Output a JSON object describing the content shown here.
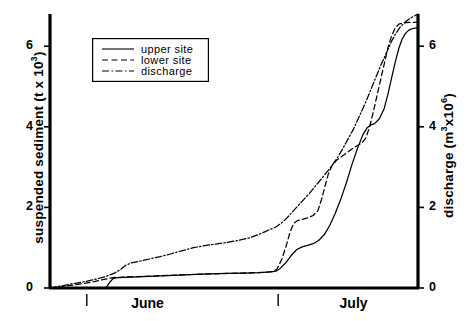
{
  "chart_data": {
    "type": "line",
    "title": "",
    "xlabel": "",
    "ylabel": "suspended sediment (t x 10³)",
    "ylabel_parts": {
      "main": "suspended sediment (t x 10",
      "sup": "3",
      "tail": ")"
    },
    "y2label": "discharge (m³x10⁶)",
    "y2label_parts": {
      "main": "discharge (m",
      "sup": "3",
      "mid": "x10",
      "sup2": "6",
      "tail": ")"
    },
    "ylim": [
      0,
      6.8
    ],
    "y2lim": [
      0,
      6.8
    ],
    "yticks": [
      "0",
      "2",
      "4",
      "6"
    ],
    "ytick_values": [
      0,
      2,
      4,
      6
    ],
    "y2ticks": [
      "0",
      "2",
      "4",
      "6"
    ],
    "y2tick_values": [
      0,
      2,
      4,
      6
    ],
    "xticks": [
      "June",
      "July"
    ],
    "xtick_marks": [
      0.1,
      0.62
    ],
    "grid": false,
    "legend_position": "upper left",
    "legend_entries": [
      {
        "label": "upper site",
        "style": "solid"
      },
      {
        "label": "lower site",
        "style": "dashed"
      },
      {
        "label": "discharge",
        "style": "dashdot"
      }
    ],
    "series": [
      {
        "name": "upper site",
        "style": "solid",
        "axis": "left",
        "points": [
          [
            0.0,
            0.0
          ],
          [
            0.04,
            0.0
          ],
          [
            0.08,
            0.0
          ],
          [
            0.12,
            0.0
          ],
          [
            0.15,
            0.0
          ],
          [
            0.155,
            0.04
          ],
          [
            0.163,
            0.15
          ],
          [
            0.172,
            0.24
          ],
          [
            0.185,
            0.26
          ],
          [
            0.22,
            0.27
          ],
          [
            0.27,
            0.29
          ],
          [
            0.32,
            0.31
          ],
          [
            0.38,
            0.33
          ],
          [
            0.43,
            0.35
          ],
          [
            0.48,
            0.36
          ],
          [
            0.53,
            0.37
          ],
          [
            0.57,
            0.38
          ],
          [
            0.6,
            0.4
          ],
          [
            0.615,
            0.42
          ],
          [
            0.625,
            0.48
          ],
          [
            0.64,
            0.62
          ],
          [
            0.655,
            0.8
          ],
          [
            0.67,
            0.95
          ],
          [
            0.685,
            1.02
          ],
          [
            0.7,
            1.06
          ],
          [
            0.715,
            1.1
          ],
          [
            0.73,
            1.18
          ],
          [
            0.745,
            1.32
          ],
          [
            0.76,
            1.55
          ],
          [
            0.775,
            1.85
          ],
          [
            0.79,
            2.2
          ],
          [
            0.805,
            2.6
          ],
          [
            0.82,
            3.05
          ],
          [
            0.835,
            3.45
          ],
          [
            0.85,
            3.8
          ],
          [
            0.862,
            3.98
          ],
          [
            0.872,
            4.05
          ],
          [
            0.882,
            4.08
          ],
          [
            0.895,
            4.2
          ],
          [
            0.908,
            4.45
          ],
          [
            0.918,
            4.8
          ],
          [
            0.928,
            5.2
          ],
          [
            0.938,
            5.6
          ],
          [
            0.948,
            5.95
          ],
          [
            0.957,
            6.18
          ],
          [
            0.966,
            6.32
          ],
          [
            0.975,
            6.4
          ],
          [
            0.985,
            6.44
          ],
          [
            1.0,
            6.46
          ]
        ]
      },
      {
        "name": "lower site",
        "style": "dashed",
        "axis": "left",
        "points": [
          [
            0.0,
            0.0
          ],
          [
            0.03,
            0.03
          ],
          [
            0.06,
            0.07
          ],
          [
            0.09,
            0.11
          ],
          [
            0.12,
            0.16
          ],
          [
            0.15,
            0.22
          ],
          [
            0.172,
            0.26
          ],
          [
            0.2,
            0.27
          ],
          [
            0.24,
            0.285
          ],
          [
            0.29,
            0.3
          ],
          [
            0.34,
            0.32
          ],
          [
            0.39,
            0.335
          ],
          [
            0.44,
            0.35
          ],
          [
            0.49,
            0.365
          ],
          [
            0.54,
            0.375
          ],
          [
            0.58,
            0.39
          ],
          [
            0.605,
            0.41
          ],
          [
            0.617,
            0.47
          ],
          [
            0.63,
            0.72
          ],
          [
            0.642,
            1.05
          ],
          [
            0.652,
            1.38
          ],
          [
            0.662,
            1.6
          ],
          [
            0.672,
            1.67
          ],
          [
            0.685,
            1.7
          ],
          [
            0.7,
            1.74
          ],
          [
            0.715,
            1.8
          ],
          [
            0.728,
            1.92
          ],
          [
            0.738,
            2.2
          ],
          [
            0.748,
            2.55
          ],
          [
            0.757,
            2.85
          ],
          [
            0.767,
            3.05
          ],
          [
            0.78,
            3.18
          ],
          [
            0.795,
            3.28
          ],
          [
            0.81,
            3.38
          ],
          [
            0.825,
            3.48
          ],
          [
            0.838,
            3.55
          ],
          [
            0.848,
            3.6
          ],
          [
            0.858,
            3.72
          ],
          [
            0.868,
            3.98
          ],
          [
            0.878,
            4.35
          ],
          [
            0.888,
            4.75
          ],
          [
            0.898,
            5.15
          ],
          [
            0.908,
            5.55
          ],
          [
            0.918,
            5.95
          ],
          [
            0.928,
            6.25
          ],
          [
            0.938,
            6.45
          ],
          [
            0.948,
            6.55
          ],
          [
            0.96,
            6.58
          ],
          [
            0.975,
            6.59
          ],
          [
            1.0,
            6.6
          ]
        ]
      },
      {
        "name": "discharge",
        "style": "dashdot",
        "axis": "right",
        "points": [
          [
            0.0,
            0.0
          ],
          [
            0.03,
            0.05
          ],
          [
            0.06,
            0.1
          ],
          [
            0.09,
            0.15
          ],
          [
            0.12,
            0.21
          ],
          [
            0.15,
            0.28
          ],
          [
            0.175,
            0.37
          ],
          [
            0.19,
            0.45
          ],
          [
            0.205,
            0.56
          ],
          [
            0.22,
            0.62
          ],
          [
            0.245,
            0.67
          ],
          [
            0.27,
            0.72
          ],
          [
            0.3,
            0.78
          ],
          [
            0.33,
            0.85
          ],
          [
            0.36,
            0.93
          ],
          [
            0.39,
            1.0
          ],
          [
            0.42,
            1.05
          ],
          [
            0.45,
            1.09
          ],
          [
            0.48,
            1.13
          ],
          [
            0.51,
            1.18
          ],
          [
            0.54,
            1.24
          ],
          [
            0.565,
            1.32
          ],
          [
            0.585,
            1.4
          ],
          [
            0.6,
            1.46
          ],
          [
            0.615,
            1.52
          ],
          [
            0.63,
            1.62
          ],
          [
            0.645,
            1.75
          ],
          [
            0.66,
            1.9
          ],
          [
            0.675,
            2.05
          ],
          [
            0.69,
            2.2
          ],
          [
            0.705,
            2.35
          ],
          [
            0.72,
            2.52
          ],
          [
            0.735,
            2.68
          ],
          [
            0.75,
            2.85
          ],
          [
            0.765,
            3.02
          ],
          [
            0.78,
            3.22
          ],
          [
            0.795,
            3.45
          ],
          [
            0.81,
            3.7
          ],
          [
            0.825,
            3.95
          ],
          [
            0.84,
            4.25
          ],
          [
            0.855,
            4.55
          ],
          [
            0.87,
            4.88
          ],
          [
            0.885,
            5.22
          ],
          [
            0.9,
            5.55
          ],
          [
            0.915,
            5.85
          ],
          [
            0.928,
            6.12
          ],
          [
            0.94,
            6.32
          ],
          [
            0.952,
            6.48
          ],
          [
            0.965,
            6.6
          ],
          [
            0.98,
            6.7
          ],
          [
            1.0,
            6.8
          ]
        ]
      }
    ]
  }
}
